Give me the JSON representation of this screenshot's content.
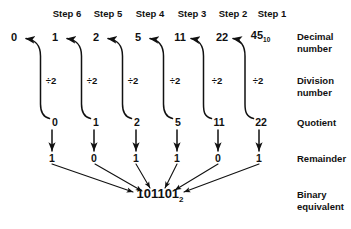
{
  "diagram": {
    "ink_color": "#111111",
    "background": "#ffffff",
    "steps": [
      {
        "label": "Step 6",
        "x": 67
      },
      {
        "label": "Step 5",
        "x": 108
      },
      {
        "label": "Step 4",
        "x": 150
      },
      {
        "label": "Step 3",
        "x": 192
      },
      {
        "label": "Step 2",
        "x": 233
      },
      {
        "label": "Step 1",
        "x": 272
      }
    ],
    "rows": {
      "decimal": {
        "label_line1": "Decimal",
        "label_line2": "number",
        "y": 37,
        "values": [
          {
            "text": "0",
            "x": 14
          },
          {
            "text": "1",
            "x": 55
          },
          {
            "text": "2",
            "x": 96
          },
          {
            "text": "5",
            "x": 138
          },
          {
            "text": "11",
            "x": 180
          },
          {
            "text": "22",
            "x": 222
          },
          {
            "text": "45",
            "subscript": "10",
            "x": 259
          }
        ]
      },
      "division": {
        "label_line1": "Division",
        "label_line2": "number",
        "y": 81,
        "values": [
          {
            "text": "÷2",
            "x": 51
          },
          {
            "text": "÷2",
            "x": 92
          },
          {
            "text": "÷2",
            "x": 133
          },
          {
            "text": "÷2",
            "x": 175
          },
          {
            "text": "÷2",
            "x": 217
          },
          {
            "text": "÷2",
            "x": 258
          }
        ]
      },
      "quotient": {
        "label_line1": "Quotient",
        "label_line2": "",
        "y": 122,
        "values": [
          {
            "text": "0",
            "x": 55
          },
          {
            "text": "1",
            "x": 96
          },
          {
            "text": "2",
            "x": 137
          },
          {
            "text": "5",
            "x": 178
          },
          {
            "text": "11",
            "x": 219
          },
          {
            "text": "22",
            "x": 261
          }
        ]
      },
      "remainder": {
        "label_line1": "Remainder",
        "label_line2": "",
        "y": 158,
        "values": [
          {
            "text": "1",
            "x": 52
          },
          {
            "text": "0",
            "x": 94
          },
          {
            "text": "1",
            "x": 136
          },
          {
            "text": "1",
            "x": 177
          },
          {
            "text": "0",
            "x": 218
          },
          {
            "text": "1",
            "x": 259
          }
        ]
      },
      "binary": {
        "label_line1": "Binary",
        "label_line2": "equivalent",
        "y": 195,
        "result": "101101",
        "result_subscript": "2",
        "result_x": 160
      }
    },
    "row_label_x": 297,
    "row_label_positions": {
      "decimal_y": 31,
      "division_y": 75,
      "quotient_y": 117,
      "remainder_y": 153,
      "binary_y": 189
    }
  }
}
